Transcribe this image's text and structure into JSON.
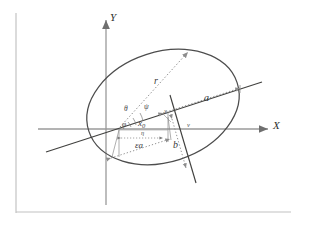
{
  "figure": {
    "type": "geometry-diagram",
    "background_color": "#ffffff",
    "frame_color": "#b8b8b8",
    "axis_color": "#9a9a9a",
    "curve_color": "#4a4a4a",
    "line_color": "#3f3f3f",
    "dotted_color": "#8d8d8d",
    "label_color": "#3a3a3a"
  },
  "axes": {
    "x_label": "X",
    "y_label": "Y",
    "x_axis_name": "horizontal-axis",
    "y_axis_name": "vertical-axis",
    "origin": {
      "x": 118,
      "y": 129
    }
  },
  "ellipse": {
    "center": {
      "x": 163,
      "y": 107
    },
    "semi_major": 78,
    "semi_minor": 55,
    "rotation_deg": -18
  },
  "labels": {
    "radius": "r",
    "semi_major": "a",
    "semi_minor": "b",
    "focal_offset": "εa",
    "x_naught": "x",
    "x_naught_sub": "0",
    "angle_theta": "θ",
    "angle_psi": "ψ",
    "angle_phi": "φ",
    "angle_chi": "χ",
    "angle_eta": "η",
    "angle_nu": "ν"
  },
  "icons": {
    "x_arrow": "arrow-right-icon",
    "y_arrow": "arrow-up-icon",
    "radius_arrow": "arrow-head-icon",
    "measure_arrow": "double-arrow-icon"
  }
}
